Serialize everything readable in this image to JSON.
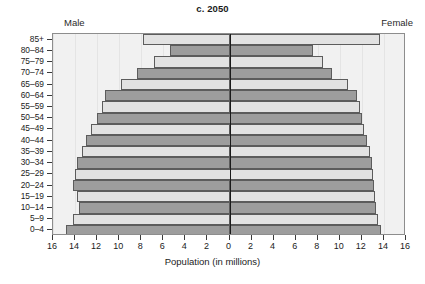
{
  "chart_data": {
    "type": "bar",
    "subtype": "population-pyramid",
    "title": "c. 2050",
    "xlabel": "Population (in millions)",
    "ylabel": "",
    "grid": true,
    "legend_position": "inline-top",
    "left_series_label": "Male",
    "right_series_label": "Female",
    "xlim": [
      -16,
      16
    ],
    "xticks": [
      16,
      14,
      12,
      10,
      8,
      6,
      4,
      2,
      0,
      2,
      4,
      6,
      8,
      10,
      12,
      14,
      16
    ],
    "categories": [
      "85+",
      "80–84",
      "75–79",
      "70–74",
      "65–69",
      "60–64",
      "55–59",
      "50–54",
      "45–49",
      "40–44",
      "35–39",
      "30–34",
      "25–29",
      "20–24",
      "15–19",
      "10–14",
      "5–9",
      "0–4"
    ],
    "series": [
      {
        "name": "Male",
        "side": "left",
        "values": [
          7.8,
          5.4,
          6.8,
          8.4,
          9.8,
          11.3,
          11.6,
          12.0,
          12.6,
          13.0,
          13.4,
          13.8,
          14.0,
          14.2,
          13.8,
          13.6,
          14.2,
          14.8
        ]
      },
      {
        "name": "Female",
        "side": "right",
        "values": [
          13.6,
          7.6,
          8.5,
          9.3,
          10.7,
          11.6,
          11.8,
          12.0,
          12.2,
          12.5,
          12.7,
          12.9,
          13.0,
          13.1,
          13.2,
          13.3,
          13.5,
          13.7
        ]
      }
    ],
    "bar_shades": [
      "light",
      "dark",
      "light",
      "dark",
      "light",
      "dark",
      "light",
      "dark",
      "light",
      "dark",
      "light",
      "dark",
      "light",
      "dark",
      "light",
      "dark",
      "light",
      "dark"
    ],
    "colors": {
      "bar_light": "#e2e2e2",
      "bar_dark": "#9d9d9d",
      "bar_border": "#5c5c5c",
      "plot_background": "#f1f1f1",
      "axis": "#8d8d8d",
      "zero_line": "#1a1a1a",
      "text": "#1b1b1b"
    }
  }
}
